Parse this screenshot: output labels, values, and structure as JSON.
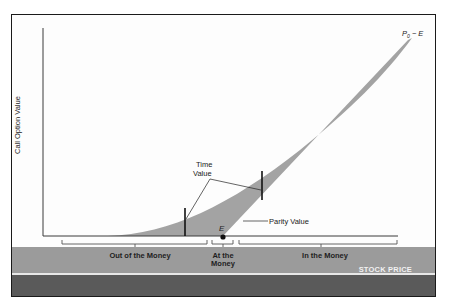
{
  "axes": {
    "y_label": "Call Option Value",
    "x_label": "STOCK PRICE"
  },
  "annotations": {
    "upper_right_label_main": "P",
    "upper_right_label_sub": "0",
    "upper_right_label_rest": " − E",
    "strike_label": "E",
    "time_value_line1": "Time",
    "time_value_line2": "Value",
    "parity_value": "Parity Value"
  },
  "regions": [
    {
      "label": "Out of the Money"
    },
    {
      "label_line1": "At the",
      "label_line2": "Money"
    },
    {
      "label": "In the Money"
    }
  ],
  "colors": {
    "shade": "#a3a3a3",
    "band_mid": "#9b9b9b",
    "band_dark": "#5a5a5a",
    "ink": "#1a1a1a"
  }
}
